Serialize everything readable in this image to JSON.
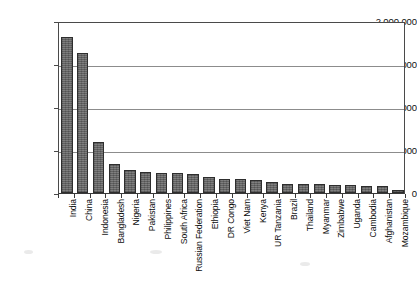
{
  "chart_data": {
    "type": "bar",
    "title": "",
    "subtitle": "",
    "xlabel": "",
    "ylabel": "",
    "ylim": [
      0,
      2000000
    ],
    "grid": true,
    "legend": false,
    "legend_position": "none",
    "orientation": "vertical",
    "bar_color": "#6e6e6e",
    "y_ticks": [
      0,
      500000,
      1000000,
      1500000,
      2000000
    ],
    "y_tick_labels": [
      "0",
      "500,000",
      "1,000,000",
      "1,500,000",
      "2,000,000"
    ],
    "categories": [
      "India",
      "China",
      "Indonesia",
      "Bangladesh",
      "Nigeria",
      "Pakistan",
      "Philippines",
      "South Africa",
      "Russian Federation",
      "Ethiopia",
      "DR Congo",
      "Viet Nam",
      "Kenya",
      "UR Tanzania",
      "Brazil",
      "Thailand",
      "Myanmar",
      "Zimbabwe",
      "Uganda",
      "Cambodia",
      "Afghanistan",
      "Mozambique"
    ],
    "values": [
      1810000,
      1630000,
      590000,
      340000,
      270000,
      245000,
      235000,
      230000,
      225000,
      190000,
      165000,
      160000,
      150000,
      130000,
      110000,
      105000,
      100000,
      95000,
      90000,
      85000,
      80000,
      40000
    ]
  }
}
